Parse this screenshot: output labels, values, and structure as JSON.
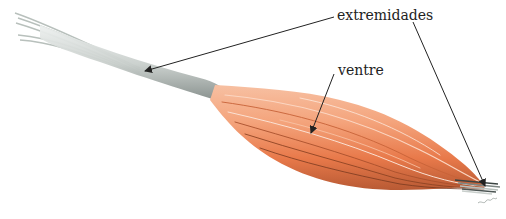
{
  "figure": {
    "labels": {
      "extremidades": "extremidades",
      "ventre": "ventre"
    },
    "colors": {
      "background": "#ffffff",
      "tendon": "#c9cfcc",
      "tendon_shadow": "#7e8784",
      "muscle_light": "#f4a47c",
      "muscle_mid": "#e8794a",
      "muscle_dark": "#b85a34",
      "arrow": "#222222"
    }
  }
}
